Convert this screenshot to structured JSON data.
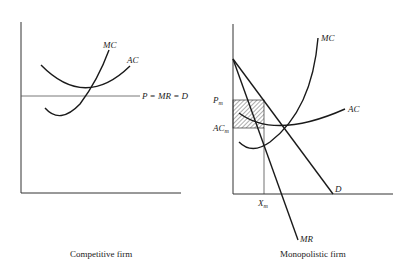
{
  "left_panel": {
    "caption": "Competitive firm",
    "labels": {
      "mc": "MC",
      "ac": "AC",
      "price_line": "P = MR = D"
    }
  },
  "right_panel": {
    "caption": "Monopolistic firm",
    "labels": {
      "mc": "MC",
      "ac": "AC",
      "demand": "D",
      "mr": "MR",
      "pm": "P",
      "pm_sub": "m",
      "acm": "AC",
      "acm_sub": "m",
      "xm": "X",
      "xm_sub": "m"
    }
  },
  "colors": {
    "line": "#1a1a1a",
    "axis": "#333333",
    "background": "#ffffff"
  }
}
